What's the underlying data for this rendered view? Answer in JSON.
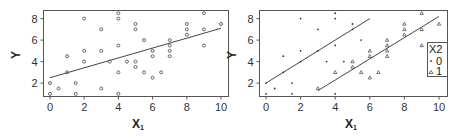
{
  "chart_data": [
    {
      "type": "scatter",
      "title": "",
      "xlabel": "X1",
      "ylabel": "Y",
      "xlim": [
        -0.4,
        10.4
      ],
      "ylim": [
        0.7,
        8.8
      ],
      "xticks": [
        "0",
        "2",
        "4",
        "6",
        "8",
        "10"
      ],
      "yticks": [
        "2",
        "4",
        "6",
        "8"
      ],
      "grid": false,
      "series": [
        {
          "name": "all",
          "marker": "circle",
          "points": [
            [
              0,
              1
            ],
            [
              0,
              2
            ],
            [
              0.5,
              1.5
            ],
            [
              1,
              3
            ],
            [
              1,
              4.5
            ],
            [
              1.5,
              1
            ],
            [
              1.5,
              2
            ],
            [
              2,
              4
            ],
            [
              2,
              5
            ],
            [
              2,
              8
            ],
            [
              3,
              1.5
            ],
            [
              3,
              5
            ],
            [
              3,
              7
            ],
            [
              3.5,
              4
            ],
            [
              4,
              1
            ],
            [
              4,
              3
            ],
            [
              4,
              5.5
            ],
            [
              4,
              8
            ],
            [
              4,
              8.5
            ],
            [
              4.5,
              4
            ],
            [
              5,
              3.5
            ],
            [
              5,
              4
            ],
            [
              5,
              7
            ],
            [
              5,
              7.5
            ],
            [
              5.5,
              3
            ],
            [
              5.5,
              6
            ],
            [
              6,
              2.5
            ],
            [
              6,
              4.5
            ],
            [
              6,
              5
            ],
            [
              6.5,
              3
            ],
            [
              7,
              4.5
            ],
            [
              7,
              5
            ],
            [
              7,
              5.5
            ],
            [
              7,
              6
            ],
            [
              8,
              6.5
            ],
            [
              8,
              7
            ],
            [
              8,
              7.5
            ],
            [
              9,
              5.5
            ],
            [
              9,
              7
            ],
            [
              9,
              8.5
            ],
            [
              10,
              7.5
            ]
          ]
        }
      ],
      "lines": [
        {
          "name": "fit",
          "from": [
            0,
            2.5
          ],
          "to": [
            10,
            7.1
          ]
        }
      ]
    },
    {
      "type": "scatter",
      "title": "",
      "xlabel": "X1",
      "ylabel": "Y",
      "xlim": [
        -0.4,
        10.4
      ],
      "ylim": [
        0.7,
        8.8
      ],
      "xticks": [
        "0",
        "2",
        "4",
        "6",
        "8",
        "10"
      ],
      "yticks": [
        "2",
        "4",
        "6",
        "8"
      ],
      "grid": false,
      "legend": {
        "title": "X2",
        "position": "right",
        "entries": [
          "0",
          "1"
        ]
      },
      "series": [
        {
          "name": "0",
          "marker": "dot",
          "points": [
            [
              0,
              1
            ],
            [
              0,
              2
            ],
            [
              0.5,
              1.5
            ],
            [
              1,
              3
            ],
            [
              1,
              4.5
            ],
            [
              1.5,
              1
            ],
            [
              1.5,
              2
            ],
            [
              2,
              4
            ],
            [
              2,
              5
            ],
            [
              2,
              8
            ],
            [
              3,
              5
            ],
            [
              3,
              7
            ],
            [
              3.5,
              4
            ],
            [
              4,
              1
            ],
            [
              4,
              5.5
            ],
            [
              4,
              8
            ],
            [
              4,
              8.5
            ],
            [
              4.5,
              4
            ],
            [
              5,
              7
            ],
            [
              5,
              7.5
            ],
            [
              5.5,
              6
            ]
          ]
        },
        {
          "name": "1",
          "marker": "triangle",
          "points": [
            [
              3,
              1.5
            ],
            [
              4,
              3
            ],
            [
              5,
              3.5
            ],
            [
              5,
              4
            ],
            [
              5.5,
              3
            ],
            [
              6,
              2.5
            ],
            [
              6,
              4.5
            ],
            [
              6,
              5
            ],
            [
              6.5,
              3
            ],
            [
              7,
              4.5
            ],
            [
              7,
              5
            ],
            [
              7,
              5.5
            ],
            [
              7,
              6
            ],
            [
              8,
              6.5
            ],
            [
              8,
              7
            ],
            [
              8,
              7.5
            ],
            [
              9,
              5.5
            ],
            [
              9,
              7
            ],
            [
              9,
              8.5
            ],
            [
              10,
              7.5
            ]
          ]
        }
      ],
      "lines": [
        {
          "name": "fit X2=0",
          "from": [
            0,
            2.0
          ],
          "to": [
            6,
            8.0
          ]
        },
        {
          "name": "fit X2=1",
          "from": [
            3,
            1.3
          ],
          "to": [
            10,
            8.2
          ]
        }
      ]
    }
  ],
  "labels": {
    "left": {
      "ylabel": "Y",
      "xlabel_main": "X",
      "xlabel_sub": "1"
    },
    "right": {
      "ylabel": "Y",
      "xlabel_main": "X",
      "xlabel_sub": "1"
    },
    "legend": {
      "title": "X2",
      "entry0": "0",
      "entry1": "1"
    }
  }
}
